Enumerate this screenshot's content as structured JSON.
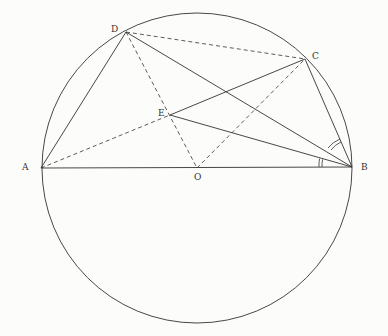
{
  "diagram": {
    "labels": {
      "A": "A",
      "B": "B",
      "C": "C",
      "D": "D",
      "E": "E",
      "O": "O"
    },
    "points": {
      "A": [
        41,
        168
      ],
      "B": [
        352,
        167
      ],
      "C": [
        305,
        59
      ],
      "D": [
        126,
        32
      ],
      "E": [
        170,
        115
      ],
      "O": [
        197,
        168
      ]
    },
    "circle": {
      "cx": 197,
      "cy": 168,
      "r": 155
    },
    "solid_segments": [
      [
        "A",
        "B"
      ],
      [
        "A",
        "D"
      ],
      [
        "D",
        "B"
      ],
      [
        "C",
        "B"
      ],
      [
        "E",
        "C"
      ],
      [
        "E",
        "B"
      ]
    ],
    "dashed_segments": [
      [
        "D",
        "C"
      ],
      [
        "D",
        "O"
      ],
      [
        "A",
        "E"
      ],
      [
        "O",
        "C"
      ]
    ],
    "angle_marks": [
      "EBA",
      "CBD"
    ]
  }
}
